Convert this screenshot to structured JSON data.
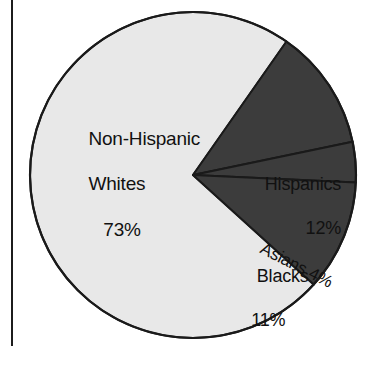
{
  "figure": {
    "background": "#ffffff",
    "rule_color": "#1c1c1c",
    "outline_color": "#1a1a1a"
  },
  "chart_data": {
    "type": "pie",
    "title": "",
    "subtitle": "",
    "xlabel": "",
    "ylabel": "",
    "legend_position": "none",
    "grid": false,
    "units": "percent",
    "total": 100,
    "start_angle_deg": -55,
    "direction": "clockwise",
    "center": {
      "x": 193,
      "y": 175
    },
    "radius": 163,
    "categories": [
      "Non-Hispanic Whites",
      "Hispanics",
      "Asians",
      "Blacks"
    ],
    "values": [
      73,
      12,
      4,
      11
    ],
    "colors": [
      "#e8e8e8",
      "#3c3c3c",
      "#3c3c3c",
      "#3c3c3c"
    ],
    "slices": [
      {
        "name": "Non-Hispanic Whites",
        "label": "Non-Hispanic",
        "label_line2": "Whites",
        "value": 73,
        "value_label": "73%",
        "color": "#e8e8e8",
        "text_color": "#111111"
      },
      {
        "name": "Hispanics",
        "label": "Hispanics",
        "value": 12,
        "value_label": "12%",
        "color": "#3c3c3c",
        "text_color": "#111111"
      },
      {
        "name": "Asians",
        "label": "Asians 4%",
        "value": 4,
        "value_label": "4%",
        "color": "#3c3c3c",
        "text_color": "#111111",
        "label_rotation_deg": 27
      },
      {
        "name": "Blacks",
        "label": "Blacks",
        "value": 11,
        "value_label": "11%",
        "color": "#3c3c3c",
        "text_color": "#111111"
      }
    ]
  }
}
